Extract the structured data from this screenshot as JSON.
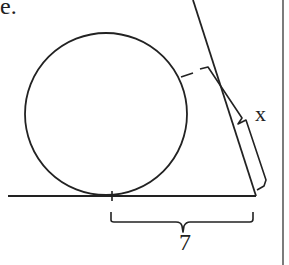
{
  "diagram": {
    "type": "geometry",
    "cropped_text_fragment": "e.",
    "labels": {
      "slanted_tangent": "x",
      "horizontal_tangent": "7"
    },
    "elements": [
      {
        "kind": "circle",
        "name": "circle"
      },
      {
        "kind": "line",
        "name": "horizontal-tangent-line"
      },
      {
        "kind": "line",
        "name": "slanted-tangent-line"
      },
      {
        "kind": "tick",
        "name": "tangent-point-base"
      },
      {
        "kind": "tick",
        "name": "tangent-point-slant"
      },
      {
        "kind": "brace",
        "name": "brace-x"
      },
      {
        "kind": "brace",
        "name": "brace-7"
      },
      {
        "kind": "border",
        "name": "right-border-line"
      }
    ],
    "colors": {
      "stroke": "#222222",
      "background": "#ffffff"
    }
  }
}
